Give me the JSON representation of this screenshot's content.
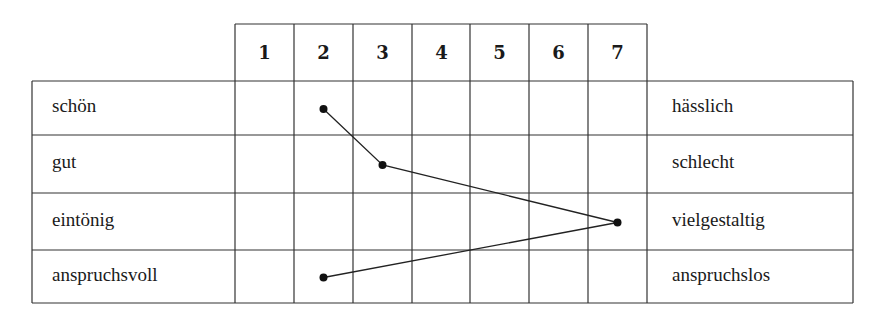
{
  "chart_data": {
    "type": "semantic-differential",
    "scale": [
      "1",
      "2",
      "3",
      "4",
      "5",
      "6",
      "7"
    ],
    "rows": [
      {
        "left": "schön",
        "right": "hässlich",
        "value": 2
      },
      {
        "left": "gut",
        "right": "schlecht",
        "value": 3
      },
      {
        "left": "eintönig",
        "right": "vielgestaltig",
        "value": 7
      },
      {
        "left": "anspruchsvoll",
        "right": "anspruchslos",
        "value": 2
      }
    ]
  }
}
